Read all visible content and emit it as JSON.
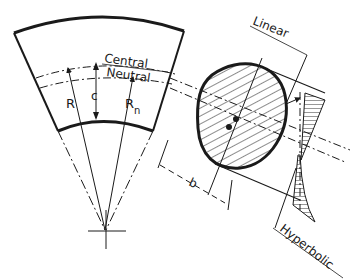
{
  "diagram": {
    "type": "technical-drawing",
    "labels": {
      "central": "Central",
      "neutral": "Neutral",
      "linear": "Linear",
      "hyperbolic": "Hyperbolic",
      "R": "R",
      "c": "c",
      "Rn": "R",
      "Rn_sub": "n",
      "b": "b"
    },
    "colors": {
      "stroke": "#1a1a1a",
      "background": "#ffffff"
    }
  }
}
